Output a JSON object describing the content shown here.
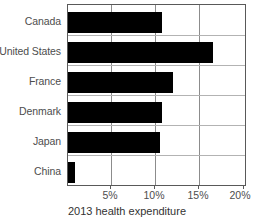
{
  "chart_data": {
    "type": "bar",
    "orientation": "horizontal",
    "title": "",
    "xlabel": "2013 health expenditure",
    "ylabel": "",
    "categories": [
      "Canada",
      "United States",
      "France",
      "Denmark",
      "Japan",
      "China"
    ],
    "values": [
      10.8,
      16.6,
      12.0,
      10.7,
      10.5,
      0.8
    ],
    "xlim": [
      0,
      20
    ],
    "xticks": [
      5,
      10,
      15,
      20
    ],
    "xticklabels": [
      "5%",
      "10%",
      "15%",
      "20%"
    ],
    "grid": "vertical-and-horizontal",
    "legend": "none",
    "bar_color": "#000000"
  },
  "axis": {
    "x_title": "2013 health expenditure",
    "tick_labels": [
      "5%",
      "10%",
      "15%",
      "20%"
    ]
  },
  "categories": [
    {
      "label": "Canada",
      "value": 10.8
    },
    {
      "label": "United States",
      "value": 16.6
    },
    {
      "label": "France",
      "value": 12.0
    },
    {
      "label": "Denmark",
      "value": 10.7
    },
    {
      "label": "Japan",
      "value": 10.5
    },
    {
      "label": "China",
      "value": 0.8
    }
  ]
}
